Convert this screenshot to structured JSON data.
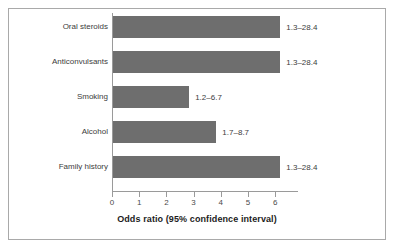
{
  "chart_data": {
    "type": "bar",
    "orientation": "horizontal",
    "title": "",
    "xlabel": "Odds ratio (95% confidence interval)",
    "ylabel": "",
    "xlim": [
      0,
      6.7
    ],
    "xticks": [
      "0",
      "1",
      "2",
      "3",
      "4",
      "5",
      "6"
    ],
    "xtick_values": [
      0,
      1,
      2,
      3,
      4,
      5,
      6
    ],
    "grid": false,
    "legend": null,
    "categories": [
      "Oral steroids",
      "Anticonvulsants",
      "Smoking",
      "Alcohol",
      "Family history"
    ],
    "values": [
      6.15,
      6.15,
      2.8,
      3.8,
      6.15
    ],
    "annotations": [
      "1.3–28.4",
      "1.3–28.4",
      "1.2–6.7",
      "1.7–8.7",
      "1.3–28.4"
    ],
    "bars": [
      {
        "category": "Oral steroids",
        "value": 6.15,
        "ci_label": "1.3–28.4"
      },
      {
        "category": "Anticonvulsants",
        "value": 6.15,
        "ci_label": "1.3–28.4"
      },
      {
        "category": "Smoking",
        "value": 2.8,
        "ci_label": "1.2–6.7"
      },
      {
        "category": "Alcohol",
        "value": 3.8,
        "ci_label": "1.7–8.7"
      },
      {
        "category": "Family history",
        "value": 6.15,
        "ci_label": "1.3–28.4"
      }
    ],
    "colors": {
      "bar_fill": "#6e6e6e",
      "axis_line": "#9a9a9a",
      "frame_border": "#a9a9a9",
      "text": "#3c3c3c",
      "background": "#ffffff"
    }
  }
}
